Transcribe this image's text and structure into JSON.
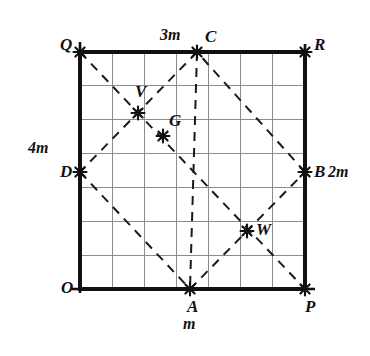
{
  "figure": {
    "type": "geometry-diagram",
    "square": {
      "corners": [
        "O",
        "P",
        "R",
        "Q"
      ],
      "pixel_bounds": {
        "left": 80,
        "top": 52,
        "right": 305,
        "bottom": 289
      },
      "grid_columns": 7,
      "grid_rows": 7,
      "grid_color": "#8c8c8c",
      "border_color": "#111111"
    },
    "vertex_labels": {
      "O": "O",
      "P": "P",
      "R": "R",
      "Q": "Q",
      "A": "A",
      "B": "B",
      "C": "C",
      "D": "D",
      "V": "V",
      "G": "G",
      "W": "W"
    },
    "dimension_labels": {
      "top": "3m",
      "left": "4m",
      "right": "2m",
      "bottom": "m"
    },
    "marked_points": [
      {
        "name": "Q",
        "x": 80,
        "y": 52,
        "marker": "star",
        "label_dx": -20,
        "label_dy": -8
      },
      {
        "name": "C",
        "x": 197,
        "y": 52,
        "marker": "star",
        "label_dx": 8,
        "label_dy": -16
      },
      {
        "name": "R",
        "x": 305,
        "y": 52,
        "marker": "star",
        "label_dx": 9,
        "label_dy": -8
      },
      {
        "name": "V",
        "x": 138,
        "y": 113,
        "marker": "star",
        "label_dx": -3,
        "label_dy": -22
      },
      {
        "name": "G",
        "x": 163,
        "y": 136,
        "marker": "star",
        "label_dx": 6,
        "label_dy": -16
      },
      {
        "name": "D",
        "x": 80,
        "y": 172,
        "marker": "star",
        "label_dx": -20,
        "label_dy": -1
      },
      {
        "name": "B",
        "x": 305,
        "y": 172,
        "marker": "star",
        "label_dx": 9,
        "label_dy": -1
      },
      {
        "name": "W",
        "x": 247,
        "y": 231,
        "marker": "star",
        "label_dx": 9,
        "label_dy": -2
      },
      {
        "name": "O",
        "x": 80,
        "y": 289,
        "marker": "none",
        "label_dx": -19,
        "label_dy": -2
      },
      {
        "name": "A",
        "x": 190,
        "y": 289,
        "marker": "star",
        "label_dx": -3,
        "label_dy": 17
      },
      {
        "name": "P",
        "x": 305,
        "y": 289,
        "marker": "star",
        "label_dx": 0,
        "label_dy": 17
      }
    ],
    "dashed_segments": [
      {
        "name": "A-B",
        "from": "A",
        "to": "B"
      },
      {
        "name": "B-C",
        "from": "B",
        "to": "C"
      },
      {
        "name": "C-D",
        "from": "C",
        "to": "D"
      },
      {
        "name": "D-A",
        "from": "D",
        "to": "A"
      },
      {
        "name": "Q-diagonal",
        "from": "Q",
        "to": "P"
      },
      {
        "name": "C-A",
        "from": "C",
        "to": "A"
      },
      {
        "name": "R-B-down",
        "from": "R",
        "to": "P"
      }
    ],
    "dimension_text_positions": {
      "top": {
        "x": 160,
        "y": 27
      },
      "left": {
        "x": 28,
        "y": 140
      },
      "right": {
        "x": 328,
        "y": 164
      },
      "bottom": {
        "x": 183,
        "y": 316
      }
    }
  }
}
